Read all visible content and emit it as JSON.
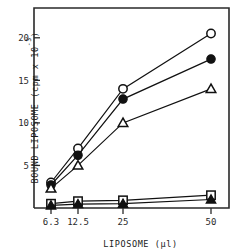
{
  "chart_data": {
    "type": "line",
    "title": "",
    "xlabel": "LIPOSOME (µl)",
    "ylabel": "BOUND LIPOSOME (cpm x 10",
    "ylabel_exponent": "-3",
    "ylabel_close": ")",
    "categories": [
      "6.3",
      "12.5",
      "25",
      "50"
    ],
    "x_tick_labels": [
      "6.3",
      "12.5",
      "25",
      "50"
    ],
    "y_tick_labels": [
      "5",
      "10",
      "15",
      "20"
    ],
    "y_tick_values": [
      5,
      10,
      15,
      20
    ],
    "ylim": [
      0,
      23.5
    ],
    "grid": false,
    "legend": "none",
    "series": [
      {
        "name": "open-circle",
        "marker": "open-circle",
        "values": [
          3.0,
          7.0,
          14.0,
          20.5
        ]
      },
      {
        "name": "filled-circle",
        "marker": "filled-circle",
        "values": [
          2.7,
          6.2,
          12.8,
          17.5
        ]
      },
      {
        "name": "open-triangle",
        "marker": "open-triangle",
        "values": [
          2.3,
          5.0,
          10.0,
          14.0
        ]
      },
      {
        "name": "open-square",
        "marker": "open-square",
        "values": [
          0.5,
          0.8,
          0.9,
          1.5
        ]
      },
      {
        "name": "filled-triangle",
        "marker": "filled-triangle",
        "values": [
          0.3,
          0.45,
          0.5,
          1.0
        ]
      }
    ]
  },
  "axes": {
    "x_axis_name": "liposome-volume-axis",
    "y_axis_name": "bound-liposome-axis"
  }
}
